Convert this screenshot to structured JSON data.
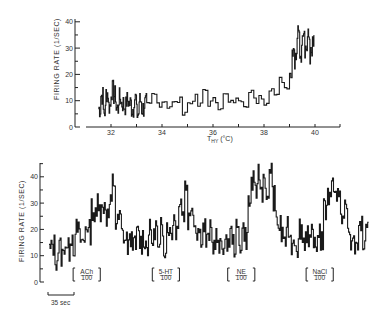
{
  "chart_data": [
    {
      "type": "line",
      "title": "",
      "xlabel": "T_HY (°C)",
      "ylabel": "FIRING RATE (1/SEC)",
      "xlim": [
        31,
        41
      ],
      "ylim": [
        0,
        40
      ],
      "xticks": [
        32,
        34,
        36,
        38,
        40
      ],
      "xtick_labels": [
        "32",
        "34",
        "36",
        "38",
        "40"
      ],
      "yticks": [
        0,
        10,
        20,
        30,
        40
      ],
      "ytick_labels": [
        "0",
        "10",
        "20",
        "30",
        "40"
      ],
      "grid": false,
      "legend": null,
      "series": [
        {
          "name": "firing rate vs hypothalamic temperature",
          "x": [
            31.5,
            31.6,
            31.7,
            31.8,
            31.9,
            32.0,
            32.1,
            32.2,
            32.3,
            32.4,
            32.5,
            32.6,
            32.7,
            32.8,
            32.9,
            33.0,
            33.1,
            33.2,
            33.3,
            33.4,
            33.6,
            33.8,
            34.0,
            34.2,
            34.4,
            34.6,
            34.8,
            35.0,
            35.2,
            35.4,
            35.6,
            35.8,
            36.0,
            36.2,
            36.4,
            36.6,
            36.8,
            37.0,
            37.2,
            37.4,
            37.6,
            37.8,
            38.0,
            38.2,
            38.4,
            38.6,
            38.8,
            39.0,
            39.1,
            39.2,
            39.3,
            39.4,
            39.5,
            39.6,
            39.7,
            39.8,
            39.9
          ],
          "y": [
            7,
            12,
            6,
            13,
            8,
            14,
            12,
            7,
            11,
            9,
            8,
            10,
            9,
            7,
            11,
            5,
            10,
            7,
            9,
            8,
            12,
            9,
            10,
            8,
            9,
            10,
            6,
            9,
            11,
            8,
            14,
            9,
            10,
            8,
            12,
            9,
            10,
            11,
            9,
            13,
            10,
            12,
            9,
            15,
            13,
            18,
            16,
            20,
            30,
            26,
            35,
            28,
            38,
            30,
            34,
            27,
            31
          ]
        }
      ]
    },
    {
      "type": "line",
      "title": "",
      "xlabel": "",
      "ylabel": "FIRING RATE (1/SEC)",
      "ylim": [
        0,
        45
      ],
      "yticks": [
        0,
        10,
        20,
        30,
        40
      ],
      "ytick_labels": [
        "0",
        "10",
        "20",
        "30",
        "40"
      ],
      "grid": false,
      "legend": null,
      "time_scale_bar": "35 sec",
      "annotations": [
        {
          "label": "ACh",
          "dose": "100",
          "x_start_sec": 32,
          "x_end_sec": 68
        },
        {
          "label": "5-HT",
          "dose": "100",
          "x_start_sec": 137,
          "x_end_sec": 173
        },
        {
          "label": "NE",
          "dose": "100",
          "x_start_sec": 237,
          "x_end_sec": 273
        },
        {
          "label": "NaCl",
          "dose": "100",
          "x_start_sec": 341,
          "x_end_sec": 377
        }
      ],
      "series": [
        {
          "name": "firing rate vs time",
          "x_sec": [
            0,
            4,
            8,
            12,
            16,
            20,
            24,
            28,
            32,
            36,
            40,
            44,
            48,
            52,
            56,
            60,
            64,
            68,
            72,
            76,
            80,
            84,
            88,
            92,
            96,
            100,
            104,
            108,
            112,
            116,
            120,
            124,
            128,
            132,
            136,
            140,
            144,
            148,
            152,
            156,
            160,
            164,
            168,
            172,
            176,
            180,
            184,
            188,
            192,
            196,
            200,
            204,
            208,
            212,
            216,
            220,
            224,
            228,
            232,
            236,
            240,
            244,
            248,
            252,
            256,
            260,
            264,
            268,
            272,
            276,
            280,
            284,
            288,
            292,
            296,
            300,
            304,
            308,
            312,
            316,
            320,
            324,
            328,
            332,
            336,
            340,
            344,
            348,
            352,
            356,
            360,
            364,
            368,
            372,
            376,
            380,
            384,
            388,
            392,
            396,
            400,
            404,
            408,
            412,
            416,
            420
          ],
          "y": [
            12,
            14,
            9,
            13,
            10,
            15,
            12,
            18,
            14,
            20,
            16,
            15,
            22,
            19,
            28,
            24,
            32,
            27,
            30,
            25,
            29,
            38,
            22,
            24,
            18,
            16,
            14,
            17,
            13,
            18,
            15,
            17,
            14,
            19,
            16,
            21,
            11,
            20,
            14,
            22,
            18,
            25,
            20,
            33,
            26,
            37,
            24,
            30,
            22,
            20,
            18,
            21,
            15,
            19,
            14,
            17,
            12,
            15,
            13,
            16,
            18,
            14,
            19,
            15,
            20,
            17,
            30,
            38,
            33,
            41,
            35,
            40,
            29,
            44,
            32,
            24,
            21,
            18,
            16,
            20,
            15,
            17,
            14,
            21,
            16,
            19,
            13,
            18,
            12,
            20,
            16,
            27,
            32,
            36,
            38,
            33,
            30,
            24,
            28,
            19,
            15,
            13,
            17,
            22,
            14,
            18
          ]
        }
      ]
    }
  ],
  "figure": {
    "top_panel": {
      "ylabel": "FIRING RATE (1/SEC)",
      "xlabel_main": "T",
      "xlabel_sub": "HY",
      "xlabel_unit": "(°C)"
    },
    "bottom_panel": {
      "ylabel": "FIRING RATE (1/SEC)",
      "scale_bar_label": "35 sec",
      "drug_labels": [
        {
          "name": "ACh",
          "dose": "100"
        },
        {
          "name": "5-HT",
          "dose": "100"
        },
        {
          "name": "NE",
          "dose": "100"
        },
        {
          "name": "NaCl",
          "dose": "100"
        }
      ]
    }
  }
}
